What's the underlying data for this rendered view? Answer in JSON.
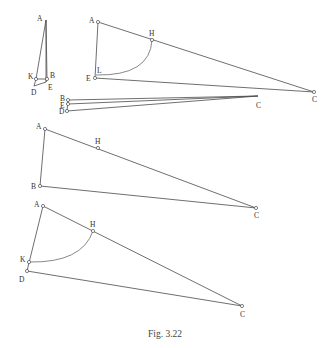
{
  "caption": "Fig. 3.22",
  "colors": {
    "line": "#4a4a4a",
    "arc": "#6a6a6a",
    "text": "#333333",
    "background": "#ffffff"
  },
  "figures": [
    {
      "id": "fig-a",
      "points": {
        "A": {
          "x": 46,
          "y": 20,
          "label": "A",
          "lx": -9,
          "ly": 1,
          "marker": false
        },
        "B": {
          "x": 47,
          "y": 79,
          "label": "B",
          "lx": 3,
          "ly": -1,
          "marker": true
        },
        "E": {
          "x": 46,
          "y": 82,
          "label": "E",
          "lx": 2,
          "ly": 8,
          "marker": false
        },
        "K": {
          "x": 36,
          "y": 79,
          "label": "K",
          "lx": -8,
          "ly": 0,
          "marker": true
        },
        "D": {
          "x": 34,
          "y": 86,
          "label": "D",
          "lx": -3,
          "ly": 9,
          "marker": false
        }
      },
      "segments": [
        [
          "A",
          "B"
        ],
        [
          "A",
          "E"
        ],
        [
          "A",
          "K"
        ],
        [
          "K",
          "B"
        ],
        [
          "K",
          "D"
        ],
        [
          "D",
          "E"
        ],
        [
          "E",
          "B"
        ]
      ],
      "arcs": []
    },
    {
      "id": "fig-b",
      "points": {
        "A": {
          "x": 98,
          "y": 22,
          "label": "A",
          "lx": -9,
          "ly": 1,
          "marker": true
        },
        "H": {
          "x": 152,
          "y": 40,
          "label": "H",
          "lx": -3,
          "ly": -4,
          "marker": true
        },
        "L": {
          "x": 96,
          "y": 75,
          "label": "L",
          "lx": 1,
          "ly": -2,
          "marker": false
        },
        "E": {
          "x": 95,
          "y": 78,
          "label": "E",
          "lx": -9,
          "ly": 3,
          "marker": true
        },
        "C": {
          "x": 314,
          "y": 92,
          "label": "C",
          "lx": -2,
          "ly": 10,
          "marker": true
        }
      },
      "segments": [
        [
          "A",
          "E"
        ],
        [
          "A",
          "C"
        ],
        [
          "E",
          "C"
        ]
      ],
      "arcs": [
        {
          "from": "H",
          "to": "L",
          "cx": 150,
          "cy": 76
        }
      ]
    },
    {
      "id": "fig-c",
      "points": {
        "B": {
          "x": 68,
          "y": 100,
          "label": "B",
          "lx": -8,
          "ly": 1,
          "marker": true
        },
        "E": {
          "x": 68,
          "y": 104,
          "label": "E",
          "lx": -8,
          "ly": 4,
          "marker": true
        },
        "D": {
          "x": 67,
          "y": 111,
          "label": "D",
          "lx": -8,
          "ly": 3,
          "marker": true
        },
        "C": {
          "x": 258,
          "y": 96,
          "label": "C",
          "lx": -2,
          "ly": 12,
          "marker": false
        }
      },
      "segments": [
        [
          "B",
          "C"
        ],
        [
          "E",
          "C"
        ],
        [
          "D",
          "C"
        ],
        [
          "B",
          "D"
        ]
      ],
      "arcs": []
    },
    {
      "id": "fig-d",
      "points": {
        "A": {
          "x": 45,
          "y": 129,
          "label": "A",
          "lx": -9,
          "ly": 0,
          "marker": true
        },
        "H": {
          "x": 98,
          "y": 148,
          "label": "H",
          "lx": -3,
          "ly": -4,
          "marker": true
        },
        "B": {
          "x": 40,
          "y": 186,
          "label": "B",
          "lx": -9,
          "ly": 3,
          "marker": true
        },
        "C": {
          "x": 256,
          "y": 208,
          "label": "C",
          "lx": -2,
          "ly": 10,
          "marker": true
        }
      },
      "segments": [
        [
          "A",
          "B"
        ],
        [
          "A",
          "C"
        ],
        [
          "B",
          "C"
        ]
      ],
      "arcs": []
    },
    {
      "id": "fig-e",
      "points": {
        "A": {
          "x": 43,
          "y": 206,
          "label": "A",
          "lx": -9,
          "ly": 1,
          "marker": true
        },
        "H": {
          "x": 93,
          "y": 231,
          "label": "H",
          "lx": -3,
          "ly": -4,
          "marker": true
        },
        "K": {
          "x": 29,
          "y": 262,
          "label": "K",
          "lx": -9,
          "ly": 0,
          "marker": true
        },
        "D": {
          "x": 27,
          "y": 271,
          "label": "D",
          "lx": -8,
          "ly": 11,
          "marker": true
        },
        "C": {
          "x": 242,
          "y": 306,
          "label": "C",
          "lx": -2,
          "ly": 11,
          "marker": true
        }
      },
      "segments": [
        [
          "A",
          "D"
        ],
        [
          "A",
          "C"
        ],
        [
          "D",
          "C"
        ]
      ],
      "arcs": [
        {
          "from": "H",
          "to": "K",
          "cx": 82,
          "cy": 263
        }
      ]
    }
  ]
}
